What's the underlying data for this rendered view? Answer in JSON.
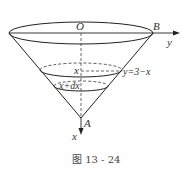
{
  "diagram": {
    "type": "inverted-cone",
    "labels": {
      "origin": "O",
      "point_b": "B",
      "apex": "A",
      "y_axis": "y",
      "x_axis": "x",
      "section_x": "x",
      "section_xdx": "x+dx",
      "edge_equation": "y=3−x"
    },
    "caption": "图 13 - 24"
  }
}
